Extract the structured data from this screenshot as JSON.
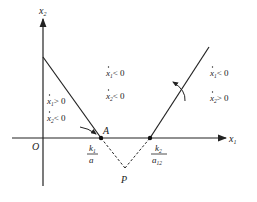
{
  "diagram": {
    "type": "phase-plane",
    "axes": {
      "x_label": "x",
      "x_sub": "1",
      "y_label": "x",
      "y_sub": "2",
      "origin_label": "O"
    },
    "points": {
      "A": {
        "label": "A",
        "tick_num": "k",
        "tick_num_sub": "1",
        "tick_den": "a"
      },
      "B": {
        "tick_num": "k",
        "tick_num_sub": "2",
        "tick_den": "a",
        "tick_den_sub": "12"
      },
      "P": {
        "label": "P"
      }
    },
    "regions": {
      "left_1": {
        "var": "x",
        "sub": "1",
        "rel": "> 0"
      },
      "left_2": {
        "var": "x",
        "sub": "2",
        "rel": "< 0"
      },
      "middle_1": {
        "var": "x",
        "sub": "1",
        "rel": "< 0"
      },
      "middle_2": {
        "var": "x",
        "sub": "2",
        "rel": "< 0"
      },
      "right_1": {
        "var": "x",
        "sub": "1",
        "rel": "< 0"
      },
      "right_2": {
        "var": "x",
        "sub": "2",
        "rel": "> 0"
      }
    },
    "colors": {
      "line": "#222222",
      "background": "#ffffff"
    }
  }
}
